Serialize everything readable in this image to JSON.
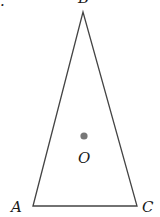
{
  "figure": {
    "type": "geometry-diagram",
    "stroke_color": "#444444",
    "dot_color": "#777777",
    "vertices": {
      "A": {
        "label": "A",
        "x": 33,
        "y": 206
      },
      "B": {
        "label": "B",
        "x": 83,
        "y": 12
      },
      "C": {
        "label": "C",
        "x": 137,
        "y": 206
      }
    },
    "point_O": {
      "label": "O",
      "x": 84,
      "y": 136
    },
    "corner_mark": "."
  }
}
